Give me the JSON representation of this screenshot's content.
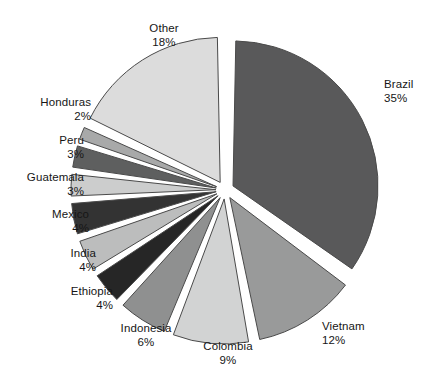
{
  "chart_data": {
    "type": "pie",
    "title": "",
    "subtitle": "",
    "xlabel": "",
    "ylabel": "",
    "legend_position": "none",
    "grid": false,
    "exploded": true,
    "units": "percent",
    "total": 100,
    "start_angle_deg": 0,
    "direction": "clockwise",
    "categories": [
      "Brazil",
      "Vietnam",
      "Colombia",
      "Indonesia",
      "Ethiopia",
      "India",
      "Mexico",
      "Guatemala",
      "Peru",
      "Honduras",
      "Other"
    ],
    "values": [
      35,
      12,
      9,
      6,
      4,
      4,
      4,
      3,
      3,
      2,
      18
    ],
    "slices": [
      {
        "label": "Brazil",
        "value": 35,
        "pct_text": "35%",
        "color": "#59595a",
        "label_align": "left",
        "label_x": 384,
        "label_y": 78
      },
      {
        "label": "Vietnam",
        "value": 12,
        "pct_text": "12%",
        "color": "#999a9a",
        "label_align": "left",
        "label_x": 322,
        "label_y": 320
      },
      {
        "label": "Colombia",
        "value": 9,
        "pct_text": "9%",
        "color": "#d2d3d3",
        "label_align": "center",
        "label_x": 228,
        "label_y": 340
      },
      {
        "label": "Indonesia",
        "value": 6,
        "pct_text": "6%",
        "color": "#8f9090",
        "label_align": "center",
        "label_x": 146,
        "label_y": 322
      },
      {
        "label": "Ethiopia",
        "value": 4,
        "pct_text": "4%",
        "color": "#262626",
        "label_align": "right",
        "label_x": 113,
        "label_y": 285
      },
      {
        "label": "India",
        "value": 4,
        "pct_text": "4%",
        "color": "#bcbdbd",
        "label_align": "right",
        "label_x": 96,
        "label_y": 247
      },
      {
        "label": "Mexico",
        "value": 4,
        "pct_text": "4%",
        "color": "#333333",
        "label_align": "right",
        "label_x": 89,
        "label_y": 208
      },
      {
        "label": "Guatemala",
        "value": 3,
        "pct_text": "3%",
        "color": "#cccdcd",
        "label_align": "right",
        "label_x": 84,
        "label_y": 171
      },
      {
        "label": "Peru",
        "value": 3,
        "pct_text": "3%",
        "color": "#5e5f5f",
        "label_align": "right",
        "label_x": 84,
        "label_y": 134
      },
      {
        "label": "Honduras",
        "value": 2,
        "pct_text": "2%",
        "color": "#a8a9a9",
        "label_align": "right",
        "label_x": 91,
        "label_y": 96
      },
      {
        "label": "Other",
        "value": 18,
        "pct_text": "18%",
        "color": "#dcdcdc",
        "label_align": "center",
        "label_x": 164,
        "label_y": 22
      }
    ],
    "geometry": {
      "center_x": 225,
      "center_y": 190,
      "radius": 145,
      "explode_offset": 9,
      "gap_deg": 2.2
    },
    "style": {
      "background": "#ffffff",
      "outline_color": "#4a4a4a",
      "text_color": "#161616"
    }
  }
}
